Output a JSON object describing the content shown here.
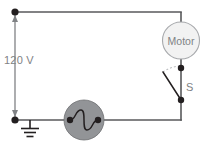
{
  "figure": {
    "name": "circuit-diagram",
    "type": "schematic",
    "width": 205,
    "height": 141,
    "background_color": "#ffffff"
  },
  "labels": {
    "voltage": "120 V",
    "motor": "Motor",
    "switch": "S"
  },
  "components": [
    {
      "id": "voltage-source-arrow",
      "name": "voltage-arrow",
      "label": "120 V",
      "color": "#808285"
    },
    {
      "id": "motor",
      "name": "motor",
      "label": "Motor",
      "shape": "circle",
      "fill": "#f2f2f2",
      "stroke": "#a7a9ac",
      "cx": 181,
      "cy": 40.5,
      "r": 18.5
    },
    {
      "id": "switch",
      "name": "switch",
      "label": "S",
      "state": "open",
      "color": "#231f20",
      "top_node": [
        181,
        68
      ],
      "bottom_node": [
        181,
        100
      ]
    },
    {
      "id": "ac-source",
      "name": "ac-source",
      "label": "",
      "shape": "circle",
      "fill": "#929497",
      "stroke": "#6d6e71",
      "cx": 84,
      "cy": 120,
      "r": 20
    },
    {
      "id": "ground",
      "name": "ground",
      "label": "",
      "color": "#231f20",
      "x": 30,
      "y": 120
    }
  ],
  "nodes": [
    {
      "name": "top-left-node",
      "x": 15,
      "y": 12
    },
    {
      "name": "bottom-left-node",
      "x": 15,
      "y": 120
    },
    {
      "name": "source-left-node",
      "x": 70,
      "y": 120
    },
    {
      "name": "source-right-node",
      "x": 98,
      "y": 120
    },
    {
      "name": "switch-top-node",
      "x": 181,
      "y": 68
    },
    {
      "name": "switch-bottom-node",
      "x": 181,
      "y": 100
    }
  ],
  "wires": [
    {
      "name": "top-wire",
      "from": [
        15,
        12
      ],
      "to": [
        181,
        12
      ]
    },
    {
      "name": "motor-top-lead",
      "from": [
        181,
        12
      ],
      "to": [
        181,
        22
      ]
    },
    {
      "name": "motor-bottom-lead",
      "from": [
        181,
        59
      ],
      "to": [
        181,
        68
      ]
    },
    {
      "name": "switch-right-wire",
      "from": [
        181,
        68
      ],
      "to": [
        181,
        100
      ]
    },
    {
      "name": "bottom-right-wire",
      "from": [
        98,
        120
      ],
      "to": [
        181,
        120
      ]
    },
    {
      "name": "switch-to-bottom-wire",
      "from": [
        181,
        100
      ],
      "to": [
        181,
        120
      ]
    },
    {
      "name": "bottom-left-wire",
      "from": [
        15,
        120
      ],
      "to": [
        70,
        120
      ]
    },
    {
      "name": "left-vertical-wire",
      "from": [
        15,
        12
      ],
      "to": [
        15,
        120
      ]
    }
  ]
}
